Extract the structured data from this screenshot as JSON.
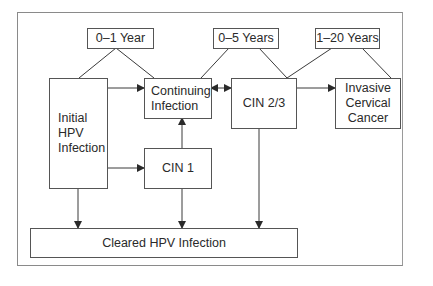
{
  "diagram": {
    "type": "flowchart",
    "title": "",
    "time_labels": {
      "t1": "0–1 Year",
      "t2": "0–5 Years",
      "t3": "1–20 Years"
    },
    "nodes": {
      "initial": "Initial\nHPV\nInfection",
      "continuing": "Continuing\nInfection",
      "cin23": "CIN 2/3",
      "invasive": "Invasive\nCervical\nCancer",
      "cin1": "CIN 1",
      "cleared": "Cleared HPV Infection"
    },
    "edges": [
      {
        "from": "Initial HPV Infection",
        "to": "Continuing Infection"
      },
      {
        "from": "Initial HPV Infection",
        "to": "CIN 1"
      },
      {
        "from": "Initial HPV Infection",
        "to": "Cleared HPV Infection"
      },
      {
        "from": "CIN 1",
        "to": "Continuing Infection"
      },
      {
        "from": "CIN 1",
        "to": "Cleared HPV Infection"
      },
      {
        "from": "Continuing Infection",
        "to": "CIN 2/3",
        "bidirectional": true
      },
      {
        "from": "CIN 2/3",
        "to": "Invasive Cervical Cancer"
      },
      {
        "from": "CIN 2/3",
        "to": "Cleared HPV Infection"
      }
    ],
    "colors": {
      "line": "#3a3a3a",
      "border": "#555555",
      "frame": "#8a8a8a"
    }
  }
}
